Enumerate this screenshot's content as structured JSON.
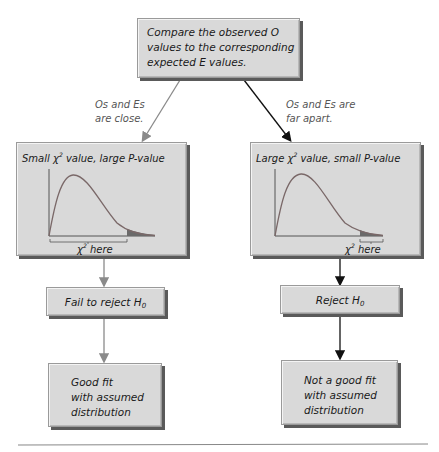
{
  "top_box": {
    "lines": [
      "Compare the observed O",
      "values to the corresponding",
      "expected E values."
    ]
  },
  "branch_labels": {
    "left": [
      "Os and Es",
      "are close."
    ],
    "right": [
      "Os and Es are",
      "far apart."
    ]
  },
  "left_panel": {
    "title_prefix": "Small",
    "chi_symbol": "χ",
    "superscript": "2",
    "title_suffix": "value, large P-value",
    "axis_label_symbol": "χ",
    "axis_label_sup": "2",
    "axis_label_text": "here"
  },
  "right_panel": {
    "title_prefix": "Large",
    "chi_symbol": "χ",
    "superscript": "2",
    "title_suffix": "value, small P-value",
    "axis_label_symbol": "χ",
    "axis_label_sup": "2",
    "axis_label_text": "here"
  },
  "left_decision": {
    "text": "Fail to reject H",
    "subscript": "0"
  },
  "right_decision": {
    "text": "Reject H",
    "subscript": "0"
  },
  "left_conclusion": {
    "lines": [
      "Good fit",
      "with assumed",
      "distribution"
    ]
  },
  "right_conclusion": {
    "lines": [
      "Not a good fit",
      "with assumed",
      "distribution"
    ]
  },
  "colors": {
    "box_fill": "#d9d9d9",
    "box_shadow": "#5a5a5a",
    "gray_arrow": "#8a8a8a",
    "black_arrow": "#111111",
    "curve": "#7a6868",
    "tail_fill": "#6a6a6a"
  }
}
